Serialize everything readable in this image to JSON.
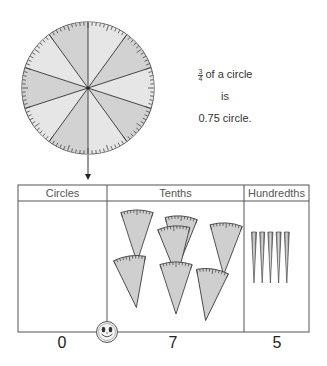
{
  "circle": {
    "sectors": 10,
    "ticks": 100,
    "fill_light": "#e6e6e6",
    "fill_dark": "#d2d2d2"
  },
  "caption": {
    "fraction_numerator": "3",
    "fraction_denominator": "4",
    "line1_text": "of a circle",
    "line2_text": "is",
    "line3_text": "0.75 circle."
  },
  "table": {
    "columns": [
      {
        "header": "Circles",
        "count": "0"
      },
      {
        "header": "Tenths",
        "count": "7"
      },
      {
        "header": "Hundredths",
        "count": "5"
      }
    ]
  },
  "pieces": {
    "tenth_wedges": 7,
    "hundredth_slivers": 5,
    "wedge_fill": "#cfcfcf",
    "outline": "#444444"
  },
  "mascot": "smiley-face"
}
